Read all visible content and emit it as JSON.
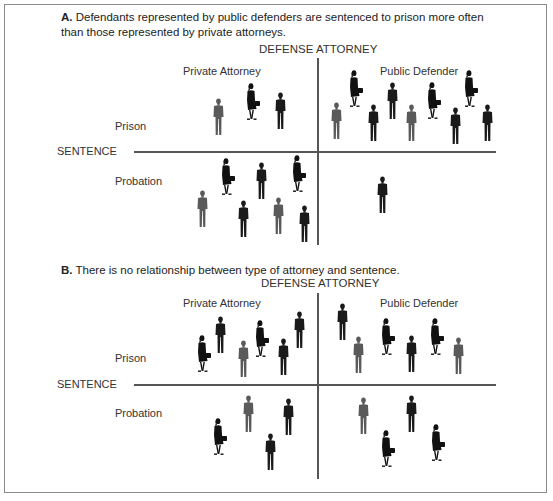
{
  "colors": {
    "man_dark": "#1a1a1a",
    "man_gray": "#5a5a5a",
    "woman": "#111111",
    "line": "#555555",
    "frame": "#8a8a8a"
  },
  "panels": [
    {
      "id": "A",
      "letter": "A.",
      "statement": "Defendants represented by public defenders are sentenced to prison more often than those represented by private attorneys.",
      "column_axis": "DEFENSE ATTORNEY",
      "row_axis": "SENTENCE",
      "columns": [
        "Private Attorney",
        "Public Defender"
      ],
      "rows": [
        "Prison",
        "Probation"
      ],
      "counts": {
        "private_prison": 3,
        "public_prison": 9,
        "private_probation": 7,
        "public_probation": 1
      }
    },
    {
      "id": "B",
      "letter": "B.",
      "statement": "There is no relationship between type of attorney and sentence.",
      "column_axis": "DEFENSE ATTORNEY",
      "row_axis": "SENTENCE",
      "columns": [
        "Private Attorney",
        "Public Defender"
      ],
      "rows": [
        "Prison",
        "Probation"
      ],
      "counts": {
        "private_prison": 6,
        "public_prison": 6,
        "private_probation": 4,
        "public_probation": 4
      }
    }
  ],
  "figures": {
    "A": [
      {
        "t": "mg",
        "x": 212,
        "y": 98
      },
      {
        "t": "w",
        "x": 245,
        "y": 83
      },
      {
        "t": "md",
        "x": 274,
        "y": 92
      },
      {
        "t": "w",
        "x": 348,
        "y": 70
      },
      {
        "t": "w",
        "x": 426,
        "y": 82
      },
      {
        "t": "w",
        "x": 463,
        "y": 70
      },
      {
        "t": "md",
        "x": 386,
        "y": 82
      },
      {
        "t": "mg",
        "x": 330,
        "y": 102
      },
      {
        "t": "md",
        "x": 367,
        "y": 104
      },
      {
        "t": "mg",
        "x": 405,
        "y": 104
      },
      {
        "t": "md",
        "x": 449,
        "y": 107
      },
      {
        "t": "md",
        "x": 481,
        "y": 104
      },
      {
        "t": "w",
        "x": 220,
        "y": 158
      },
      {
        "t": "md",
        "x": 255,
        "y": 162
      },
      {
        "t": "w",
        "x": 291,
        "y": 155
      },
      {
        "t": "mg",
        "x": 196,
        "y": 190
      },
      {
        "t": "md",
        "x": 237,
        "y": 200
      },
      {
        "t": "mg",
        "x": 272,
        "y": 197
      },
      {
        "t": "md",
        "x": 298,
        "y": 205
      },
      {
        "t": "md",
        "x": 376,
        "y": 176
      }
    ],
    "B": [
      {
        "t": "w",
        "x": 196,
        "y": 335
      },
      {
        "t": "md",
        "x": 214,
        "y": 316
      },
      {
        "t": "mg",
        "x": 237,
        "y": 340
      },
      {
        "t": "w",
        "x": 254,
        "y": 320
      },
      {
        "t": "md",
        "x": 277,
        "y": 338
      },
      {
        "t": "md",
        "x": 293,
        "y": 311
      },
      {
        "t": "md",
        "x": 336,
        "y": 303
      },
      {
        "t": "mg",
        "x": 352,
        "y": 336
      },
      {
        "t": "w",
        "x": 380,
        "y": 318
      },
      {
        "t": "md",
        "x": 405,
        "y": 335
      },
      {
        "t": "w",
        "x": 429,
        "y": 318
      },
      {
        "t": "mg",
        "x": 452,
        "y": 337
      },
      {
        "t": "w",
        "x": 212,
        "y": 418
      },
      {
        "t": "mg",
        "x": 242,
        "y": 395
      },
      {
        "t": "md",
        "x": 264,
        "y": 433
      },
      {
        "t": "md",
        "x": 282,
        "y": 398
      },
      {
        "t": "mg",
        "x": 357,
        "y": 397
      },
      {
        "t": "w",
        "x": 380,
        "y": 430
      },
      {
        "t": "md",
        "x": 405,
        "y": 395
      },
      {
        "t": "w",
        "x": 430,
        "y": 424
      }
    ]
  }
}
